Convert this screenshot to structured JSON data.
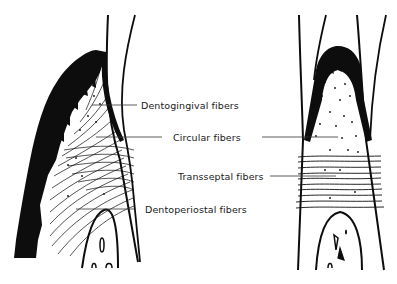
{
  "diagram": {
    "panels": [
      {
        "id": "left",
        "view": "labial section of tooth with gingiva"
      },
      {
        "id": "right",
        "view": "interdental section"
      }
    ],
    "labels": [
      {
        "id": "dentogingival",
        "text": "Dentogingival fibers"
      },
      {
        "id": "circular",
        "text": "Circular fibers"
      },
      {
        "id": "transseptal",
        "text": "Transseptal fibers"
      },
      {
        "id": "dentoperiostal",
        "text": "Dentoperiostal fibers"
      }
    ],
    "colors": {
      "ink": "#0d0d0d",
      "background": "#ffffff",
      "leader_line": "#333333"
    }
  }
}
